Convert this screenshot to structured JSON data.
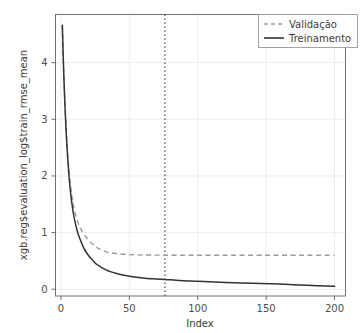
{
  "chart_data": {
    "type": "line",
    "title": "",
    "xlabel": "Index",
    "ylabel": "xgb.reg$evaluation_log$train_rmse_mean",
    "xlim": [
      -4,
      208
    ],
    "ylim": [
      -0.12,
      4.85
    ],
    "xticks": [
      0,
      50,
      100,
      150,
      200
    ],
    "xticklabels": [
      "0",
      "50",
      "100",
      "150",
      "200"
    ],
    "yticks": [
      0,
      1,
      2,
      3,
      4
    ],
    "yticklabels": [
      "0",
      "1",
      "2",
      "3",
      "4"
    ],
    "grid": true,
    "legend_position": "top-right",
    "annotations": [
      {
        "name": "best-iteration-vline",
        "type": "vertical-line",
        "x": 76,
        "style": "dotted",
        "color": "#555555"
      }
    ],
    "series": [
      {
        "name": "Validação",
        "style": "dashed",
        "color": "#9a9a9a",
        "x": [
          1,
          2,
          3,
          4,
          5,
          6,
          7,
          8,
          9,
          10,
          12,
          14,
          16,
          18,
          20,
          22,
          24,
          26,
          28,
          30,
          33,
          36,
          40,
          45,
          50,
          60,
          70,
          76,
          80,
          90,
          100,
          120,
          140,
          160,
          180,
          200
        ],
        "y": [
          4.66,
          3.84,
          3.22,
          2.74,
          2.36,
          2.06,
          1.83,
          1.64,
          1.5,
          1.38,
          1.21,
          1.09,
          1.0,
          0.93,
          0.87,
          0.82,
          0.78,
          0.74,
          0.71,
          0.69,
          0.66,
          0.645,
          0.63,
          0.618,
          0.61,
          0.605,
          0.602,
          0.6,
          0.6,
          0.6,
          0.6,
          0.6,
          0.6,
          0.6,
          0.6,
          0.6
        ]
      },
      {
        "name": "Treinamento",
        "style": "solid",
        "color": "#333333",
        "x": [
          1,
          2,
          3,
          4,
          5,
          6,
          7,
          8,
          9,
          10,
          12,
          14,
          16,
          18,
          20,
          22,
          24,
          26,
          28,
          30,
          33,
          36,
          40,
          45,
          50,
          60,
          70,
          76,
          80,
          90,
          100,
          120,
          140,
          160,
          180,
          200
        ],
        "y": [
          4.66,
          3.82,
          3.18,
          2.68,
          2.28,
          1.96,
          1.71,
          1.51,
          1.35,
          1.22,
          1.02,
          0.88,
          0.76,
          0.67,
          0.6,
          0.54,
          0.49,
          0.44,
          0.41,
          0.38,
          0.34,
          0.31,
          0.28,
          0.25,
          0.23,
          0.2,
          0.18,
          0.17,
          0.165,
          0.15,
          0.14,
          0.12,
          0.105,
          0.09,
          0.07,
          0.05
        ]
      }
    ],
    "legend": [
      {
        "label": "Validação",
        "style": "dashed",
        "color": "#9a9a9a"
      },
      {
        "label": "Treinamento",
        "style": "solid",
        "color": "#333333"
      }
    ]
  },
  "colors": {
    "background": "#ffffff",
    "frame": "#6f6f6f",
    "grid": "#ededed",
    "tick_text": "#4d4d4d",
    "validation": "#9a9a9a",
    "training": "#333333",
    "vline": "#555555",
    "legend_border": "#9a9a9a"
  }
}
